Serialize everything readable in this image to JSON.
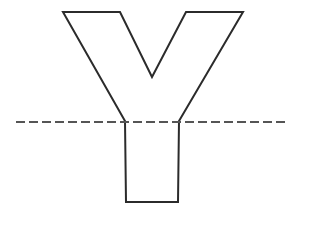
{
  "diagram": {
    "colors": {
      "background": "#ffffff",
      "outline": "#2b2b2b",
      "dashed_line": "#555555"
    },
    "shape": {
      "name": "letter-Y",
      "points": [
        [
          63,
          12
        ],
        [
          120,
          12
        ],
        [
          152,
          77
        ],
        [
          186,
          12
        ],
        [
          243,
          12
        ],
        [
          179,
          121
        ],
        [
          178,
          202
        ],
        [
          126,
          202
        ],
        [
          125,
          121
        ]
      ]
    },
    "dashed_line": {
      "x1": 16,
      "y1": 122,
      "x2": 289,
      "y2": 122,
      "dash": "9 4"
    }
  }
}
